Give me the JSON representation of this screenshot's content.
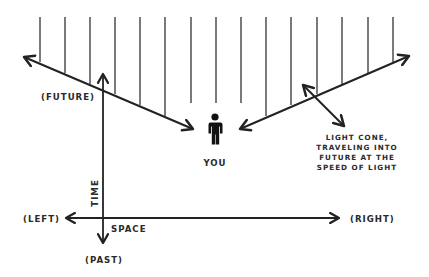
{
  "diagram": {
    "type": "spacetime-light-cone",
    "colors": {
      "background": "#ffffff",
      "ink": "#222222",
      "text": "#2a2a2a"
    },
    "labels": {
      "future": "(FUTURE)",
      "past": "(PAST)",
      "left": "(LEFT)",
      "right": "(RIGHT)",
      "time": "TIME",
      "space": "SPACE",
      "you": "YOU",
      "light_cone_lines": [
        "LIGHT CONE,",
        "TRAVELING INTO",
        "FUTURE AT THE",
        "SPEED OF LIGHT"
      ]
    },
    "icons": {
      "person": "person-icon"
    }
  }
}
